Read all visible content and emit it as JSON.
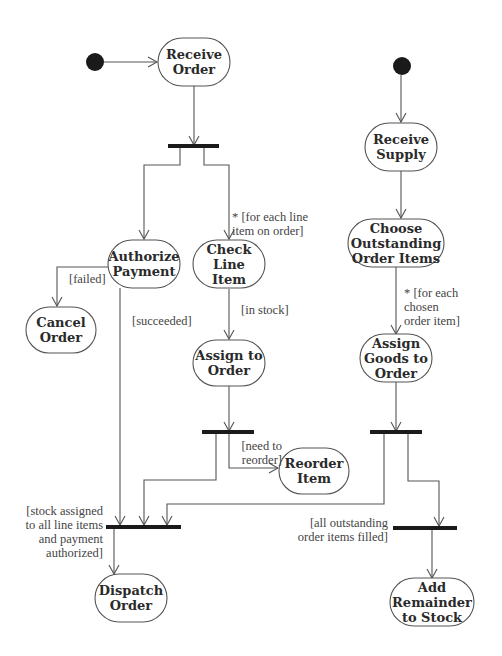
{
  "diagram": {
    "type": "UML activity diagram",
    "colors": {
      "line": "#555555",
      "fill": "#ffffff",
      "bar": "#1a1a1a",
      "text": "#2a2a2a"
    },
    "start_nodes": [
      {
        "id": "start1",
        "x": 95,
        "y": 62
      },
      {
        "id": "start2",
        "x": 402,
        "y": 66
      }
    ],
    "activities": [
      {
        "id": "receive_order",
        "lines": [
          "Receive",
          "Order"
        ],
        "x": 194,
        "y": 62,
        "w": 72,
        "h": 48
      },
      {
        "id": "authorize_payment",
        "lines": [
          "Authorize",
          "Payment"
        ],
        "x": 144,
        "y": 264,
        "w": 72,
        "h": 48
      },
      {
        "id": "check_line_item",
        "lines": [
          "Check",
          "Line",
          "Item"
        ],
        "x": 229,
        "y": 264,
        "w": 72,
        "h": 48
      },
      {
        "id": "cancel_order",
        "lines": [
          "Cancel",
          "Order"
        ],
        "x": 61,
        "y": 330,
        "w": 70,
        "h": 46
      },
      {
        "id": "assign_to_order",
        "lines": [
          "Assign to",
          "Order"
        ],
        "x": 229,
        "y": 363,
        "w": 72,
        "h": 46
      },
      {
        "id": "reorder_item",
        "lines": [
          "Reorder",
          "Item"
        ],
        "x": 314,
        "y": 471,
        "w": 70,
        "h": 46
      },
      {
        "id": "dispatch_order",
        "lines": [
          "Dispatch",
          "Order"
        ],
        "x": 131,
        "y": 598,
        "w": 72,
        "h": 48
      },
      {
        "id": "receive_supply",
        "lines": [
          "Receive",
          "Supply"
        ],
        "x": 401,
        "y": 147,
        "w": 72,
        "h": 48
      },
      {
        "id": "choose_outstanding",
        "lines": [
          "Choose",
          "Outstanding",
          "Order Items"
        ],
        "x": 396,
        "y": 243,
        "w": 96,
        "h": 48
      },
      {
        "id": "assign_goods",
        "lines": [
          "Assign",
          "Goods to",
          "Order"
        ],
        "x": 396,
        "y": 358,
        "w": 72,
        "h": 48
      },
      {
        "id": "add_remainder",
        "lines": [
          "Add",
          "Remainder",
          "to Stock"
        ],
        "x": 432,
        "y": 602,
        "w": 84,
        "h": 48
      }
    ],
    "bars": [
      {
        "id": "fork1",
        "x1": 168,
        "x2": 219,
        "y": 146
      },
      {
        "id": "fork2",
        "x1": 202,
        "x2": 254,
        "y": 432
      },
      {
        "id": "join_dispatch",
        "x1": 106,
        "x2": 181,
        "y": 527
      },
      {
        "id": "fork3",
        "x1": 370,
        "x2": 422,
        "y": 432
      },
      {
        "id": "join_remainder",
        "x1": 393,
        "x2": 457,
        "y": 528
      }
    ],
    "guards": [
      {
        "id": "g_for_each_line",
        "lines": [
          "* [for each line",
          "item on order]"
        ],
        "x": 232,
        "y": 221,
        "align": "left"
      },
      {
        "id": "g_failed",
        "lines": [
          "[failed]"
        ],
        "x": 69,
        "y": 283,
        "align": "left"
      },
      {
        "id": "g_succeeded",
        "lines": [
          "[succeeded]"
        ],
        "x": 132,
        "y": 325,
        "align": "left"
      },
      {
        "id": "g_in_stock",
        "lines": [
          "[in stock]"
        ],
        "x": 241,
        "y": 314,
        "align": "left"
      },
      {
        "id": "g_for_each_chosen",
        "lines": [
          "* [for each",
          "chosen",
          "order item]"
        ],
        "x": 404,
        "y": 297,
        "align": "left"
      },
      {
        "id": "g_need_reorder",
        "lines": [
          "[need to",
          "reorder]"
        ],
        "x": 282,
        "y": 450,
        "align": "right"
      },
      {
        "id": "g_stock_assigned",
        "lines": [
          "[stock assigned",
          "to all line items",
          "and payment",
          "authorized]"
        ],
        "x": 103,
        "y": 515,
        "align": "right"
      },
      {
        "id": "g_all_outstanding",
        "lines": [
          "[all outstanding",
          "order items filled]"
        ],
        "x": 388,
        "y": 527,
        "align": "right"
      }
    ]
  }
}
